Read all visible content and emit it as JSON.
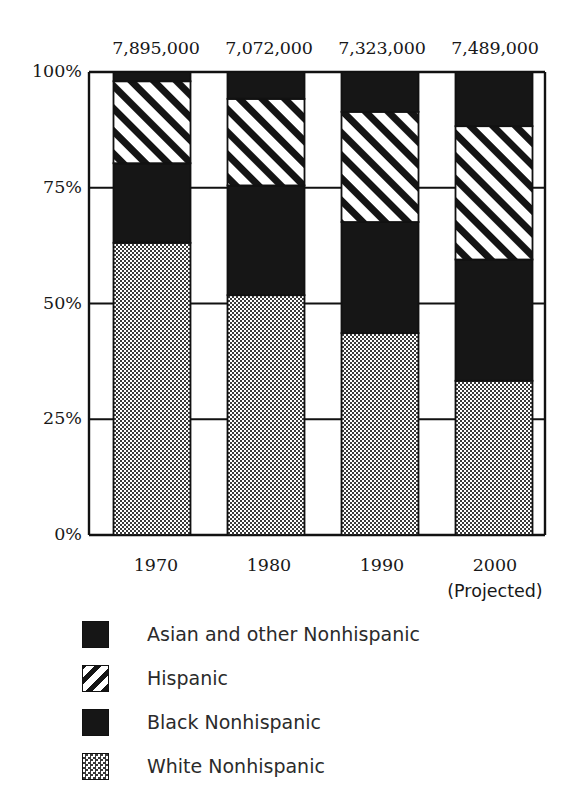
{
  "chart_data": {
    "type": "bar",
    "subtype": "stacked-percent",
    "title": "",
    "xlabel": "",
    "ylabel": "",
    "categories": [
      "1970",
      "1980",
      "1990",
      "2000"
    ],
    "category_sublabels": [
      "",
      "",
      "",
      "(Projected)"
    ],
    "ylim": [
      0,
      100
    ],
    "ytick_labels": [
      "0%",
      "25%",
      "50%",
      "75%",
      "100%"
    ],
    "ytick_values": [
      0,
      25,
      50,
      75,
      100
    ],
    "grid": false,
    "legend_position": "bottom-left",
    "stack_order_bottom_to_top": [
      "White Nonhispanic",
      "Black Nonhispanic",
      "Hispanic",
      "Asian and other Nonhispanic"
    ],
    "series": [
      {
        "name": "White Nonhispanic",
        "fill": "stipple-gray",
        "values": [
          63.1,
          51.8,
          43.6,
          33.3
        ]
      },
      {
        "name": "Black Nonhispanic",
        "fill": "solid-black",
        "values": [
          17.2,
          23.7,
          24.0,
          26.2
        ]
      },
      {
        "name": "Hispanic",
        "fill": "diagonal-hatch",
        "values": [
          17.7,
          18.7,
          23.8,
          28.8
        ]
      },
      {
        "name": "Asian and other Nonhispanic",
        "fill": "solid-black",
        "values": [
          2.0,
          5.8,
          8.6,
          11.7
        ]
      }
    ],
    "totals": [
      "7,895,000",
      "7,072,000",
      "7,323,000",
      "7,489,000"
    ],
    "colors": {
      "axis": "#111111",
      "black_fill": "#161616",
      "gray_stipple_fg": "#4a4a4a",
      "gray_stipple_bg": "#a8a8a8",
      "hatch_stroke": "#111111",
      "hatch_bg": "#ffffff"
    }
  },
  "legend": {
    "items": [
      {
        "label": "Asian and other Nonhispanic",
        "swatch": "solid-black"
      },
      {
        "label": "Hispanic",
        "swatch": "diagonal-hatch"
      },
      {
        "label": "Black Nonhispanic",
        "swatch": "solid-black"
      },
      {
        "label": "White Nonhispanic",
        "swatch": "stipple-gray"
      }
    ]
  }
}
